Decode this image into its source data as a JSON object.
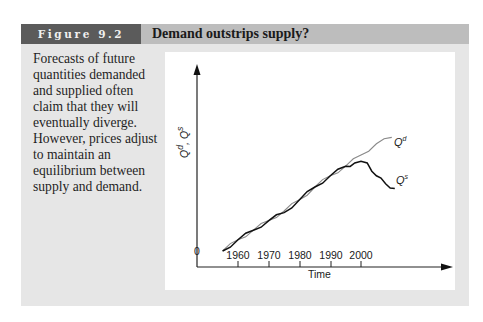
{
  "figure": {
    "number_label": "Figure 9.2",
    "title": "Demand outstrips supply?",
    "caption": "Forecasts of future quantities demanded and supplied often claim that they will eventually diverge. However, prices adjust to maintain an equilibrium between supply and demand."
  },
  "colors": {
    "panel_bg": "#e6e6e6",
    "header_bar": "#bdbdbd",
    "figure_tab": "#5b5b5b",
    "chart_bg": "#ffffff",
    "demand_line": "#8a8a8a",
    "supply_line": "#111111"
  },
  "chart_data": {
    "type": "line",
    "title": "Demand outstrips supply?",
    "xlabel": "Time",
    "ylabel": "Qd, Qs",
    "ylabel_parts": {
      "q1": "Q",
      "sup1": "d",
      "sep": ", ",
      "q2": "Q",
      "sup2": "s"
    },
    "origin_label": "0",
    "x_ticks": [
      "1960",
      "1970",
      "1980",
      "1990",
      "2000"
    ],
    "y_ticks": [],
    "grid": false,
    "legend": "inline labels at line ends",
    "xlim": [
      1946,
      2029
    ],
    "ylim": [
      0,
      100
    ],
    "series": [
      {
        "name": "Qd",
        "label_base": "Q",
        "label_sup": "d",
        "style": "thin gray",
        "x": [
          1955,
          1960,
          1965,
          1970,
          1975,
          1980,
          1985,
          1990,
          1995,
          2000,
          2005,
          2010
        ],
        "y": [
          10,
          17,
          23,
          29,
          35,
          42,
          50,
          57,
          63,
          70,
          77,
          81
        ]
      },
      {
        "name": "Qs",
        "label_base": "Q",
        "label_sup": "s",
        "style": "thick black",
        "x": [
          1955,
          1960,
          1965,
          1970,
          1975,
          1980,
          1985,
          1990,
          1995,
          1998,
          2002,
          2005,
          2008,
          2011
        ],
        "y": [
          10,
          17,
          23,
          29,
          34,
          42,
          50,
          57,
          63,
          65,
          65,
          57,
          52,
          49
        ]
      }
    ]
  }
}
